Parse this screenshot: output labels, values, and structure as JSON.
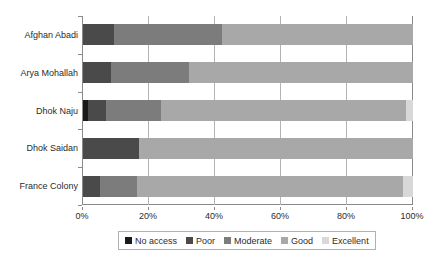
{
  "chart_data": {
    "type": "bar",
    "orientation": "horizontal",
    "stacked": true,
    "stack_mode": "percent",
    "title": "",
    "subtitle": "",
    "xlabel": "",
    "ylabel": "",
    "xlim": [
      0,
      100
    ],
    "xticks": [
      0,
      20,
      40,
      60,
      80,
      100
    ],
    "xtick_labels": [
      "0%",
      "20%",
      "40%",
      "60%",
      "80%",
      "100%"
    ],
    "grid": true,
    "grid_axis": "x",
    "legend_position": "bottom",
    "categories": [
      "Afghan Abadi",
      "Arya Mohallah",
      "Dhok Naju",
      "Dhok Saidan",
      "France Colony"
    ],
    "series": [
      {
        "name": "No access",
        "color": "#1a1a1a",
        "values": [
          0,
          0,
          1.5,
          0,
          0
        ]
      },
      {
        "name": "Poor",
        "color": "#4a4a4a",
        "values": [
          9.5,
          8.5,
          5.5,
          17,
          5
        ]
      },
      {
        "name": "Moderate",
        "color": "#7c7c7c",
        "values": [
          32.5,
          23.5,
          16.5,
          0,
          11.5
        ]
      },
      {
        "name": "Good",
        "color": "#a8a8a8",
        "values": [
          58,
          68,
          74.5,
          83,
          80.5
        ]
      },
      {
        "name": "Excellent",
        "color": "#d8d8d8",
        "values": [
          0,
          0,
          2,
          0,
          3
        ]
      }
    ]
  },
  "legend": {
    "items": [
      {
        "label": "No access",
        "color": "#1a1a1a"
      },
      {
        "label": "Poor",
        "color": "#4a4a4a"
      },
      {
        "label": "Moderate",
        "color": "#7c7c7c"
      },
      {
        "label": "Good",
        "color": "#a8a8a8"
      },
      {
        "label": "Excellent",
        "color": "#d8d8d8"
      }
    ]
  }
}
